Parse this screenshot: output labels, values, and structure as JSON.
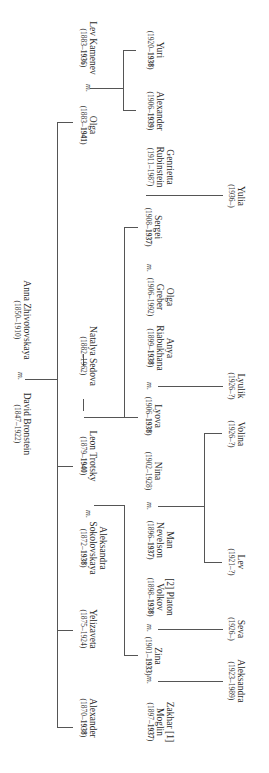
{
  "diagram": {
    "type": "family-tree",
    "orientation": "rotated-90-clockwise",
    "marriage_marker": "m.",
    "generations": [
      {
        "level": 1,
        "people": [
          {
            "id": "david",
            "name": "David Bronstein",
            "dates": "(1847–1922)"
          },
          {
            "id": "anna",
            "name": "Anna Zhivotovskaya",
            "dates": "(1850–1910)"
          }
        ],
        "couples": [
          [
            "david",
            "anna"
          ]
        ]
      },
      {
        "level": 2,
        "people": [
          {
            "id": "alexander_b",
            "name": "Alexander",
            "dates": "(1870–1938)"
          },
          {
            "id": "yelizaveta",
            "name": "Yelizaveta",
            "dates": "(1875–1924)"
          },
          {
            "id": "aleksandra_s",
            "name": "Aleksandra Sokolovskaya",
            "dates": "(1872–1938)"
          },
          {
            "id": "leon",
            "name": "Leon Trotsky",
            "dates": "(1879–1940)"
          },
          {
            "id": "natalya",
            "name": "Natalya Sedova",
            "dates": "(1882–1962)"
          },
          {
            "id": "olga_b",
            "name": "Olga",
            "dates": "(1883–1941)"
          },
          {
            "id": "kamenev",
            "name": "Lev Kamenev",
            "dates": "(1883–1936)"
          }
        ],
        "couples": [
          [
            "aleksandra_s",
            "leon"
          ],
          [
            "leon",
            "natalya"
          ],
          [
            "olga_b",
            "kamenev"
          ]
        ]
      },
      {
        "level": 3,
        "people": [
          {
            "id": "zakhar",
            "name": "Zakhar [1] Moglin",
            "dates": "(1897–1937)"
          },
          {
            "id": "zina",
            "name": "Zina",
            "dates": "(1901–1933)"
          },
          {
            "id": "platon",
            "name": "[2] Platon Volkov",
            "dates": "(1898–1938)"
          },
          {
            "id": "man",
            "name": "Man Nevelson",
            "dates": "(1896–1937)"
          },
          {
            "id": "nina",
            "name": "Nina",
            "dates": "(1902–1928)"
          },
          {
            "id": "lyova",
            "name": "Lyova",
            "dates": "(1906–1938)"
          },
          {
            "id": "anya",
            "name": "Anya Riabukhana",
            "dates": "(1899–1938)"
          },
          {
            "id": "olga_g",
            "name": "Olga Greber",
            "dates": "(1906–1992)"
          },
          {
            "id": "sergei",
            "name": "Sergei",
            "dates": "(1908–1937)"
          },
          {
            "id": "genrietta",
            "name": "Genrietta Rubinstein",
            "dates": "(1911–1987)"
          },
          {
            "id": "alexander_k",
            "name": "Alexander",
            "dates": "(1906–1939)"
          },
          {
            "id": "yuri",
            "name": "Yuri",
            "dates": "(1920–1938)"
          }
        ],
        "couples": [
          [
            "zakhar",
            "zina"
          ],
          [
            "zina",
            "platon"
          ],
          [
            "man",
            "nina"
          ],
          [
            "lyova",
            "anya"
          ],
          [
            "olga_g",
            "sergei"
          ],
          [
            "sergei",
            "genrietta"
          ]
        ]
      },
      {
        "level": 4,
        "people": [
          {
            "id": "aleksandra_m",
            "name": "Aleksandra",
            "dates": "(1923–1989)"
          },
          {
            "id": "seva",
            "name": "Seva",
            "dates": "(1926–)"
          },
          {
            "id": "lev_n",
            "name": "Lev",
            "dates": "(1921–?)"
          },
          {
            "id": "volina",
            "name": "Volina",
            "dates": "(1926–?)"
          },
          {
            "id": "lyulik",
            "name": "Lyulik",
            "dates": "(1926–?)"
          },
          {
            "id": "yulia",
            "name": "Yulia",
            "dates": "(1936–)"
          }
        ]
      }
    ]
  },
  "labels": {
    "david": {
      "name": "David Bronstein",
      "dates_pre": "(1847–1922)",
      "dates_bold": "",
      "dates_post": ""
    },
    "anna": {
      "name": "Anna Zhivotovskaya",
      "dates_pre": "(1850–1910)",
      "dates_bold": "",
      "dates_post": ""
    },
    "alexander_b": {
      "name": "Alexander",
      "dates_pre": "(1870–",
      "dates_bold": "1938",
      "dates_post": ")"
    },
    "yelizaveta": {
      "name": "Yelizaveta",
      "dates_pre": "(1875–1924)",
      "dates_bold": "",
      "dates_post": ""
    },
    "aleksandra_s_1": {
      "name": "Aleksandra"
    },
    "aleksandra_s_2": {
      "name": "Sokolovskaya",
      "dates_pre": "(1872–",
      "dates_bold": "1938",
      "dates_post": ")"
    },
    "leon": {
      "name": "Leon Trotsky",
      "dates_pre": "(1879–",
      "dates_bold": "1940",
      "dates_post": ")"
    },
    "natalya": {
      "name": "Natalya Sedova",
      "dates_pre": "(1882–1962)",
      "dates_bold": "",
      "dates_post": ""
    },
    "olga_b": {
      "name": "Olga",
      "dates_pre": "(1883–",
      "dates_bold": "1941",
      "dates_post": ")"
    },
    "kamenev": {
      "name": "Lev Kamenev",
      "dates_pre": "(1883–",
      "dates_bold": "1936",
      "dates_post": ")"
    },
    "zakhar_1": {
      "name": "Zakhar [1]"
    },
    "zakhar_2": {
      "name": "Moglin",
      "dates_pre": "(1897–",
      "dates_bold": "1937",
      "dates_post": ")"
    },
    "zina": {
      "name": "Zina",
      "dates_pre": "(1901–",
      "dates_bold": "1933",
      "dates_post": ")"
    },
    "platon_1": {
      "name": "[2] Platon"
    },
    "platon_2": {
      "name": "Volkov",
      "dates_pre": "(1898–",
      "dates_bold": "1938",
      "dates_post": ")"
    },
    "man_1": {
      "name": "Man"
    },
    "man_2": {
      "name": "Nevelson",
      "dates_pre": "(1896–",
      "dates_bold": "1937",
      "dates_post": ")"
    },
    "nina": {
      "name": "Nina",
      "dates_pre": "(1902–1928)",
      "dates_bold": "",
      "dates_post": ""
    },
    "lyova": {
      "name": "Lyova",
      "dates_pre": "(1906–",
      "dates_bold": "1938",
      "dates_post": ")"
    },
    "anya_1": {
      "name": "Anya"
    },
    "anya_2": {
      "name": "Riabukhana",
      "dates_pre": "(1899–",
      "dates_bold": "1938",
      "dates_post": ")"
    },
    "olga_g_1": {
      "name": "Olga"
    },
    "olga_g_2": {
      "name": "Greber",
      "dates_pre": "(1906–1992)",
      "dates_bold": "",
      "dates_post": ""
    },
    "sergei": {
      "name": "Sergei",
      "dates_pre": "(1908–",
      "dates_bold": "1937",
      "dates_post": ")"
    },
    "genrietta_1": {
      "name": "Genrietta"
    },
    "genrietta_2": {
      "name": "Rubinstein",
      "dates_pre": "(1911–1987)",
      "dates_bold": "",
      "dates_post": ""
    },
    "alexander_k": {
      "name": "Alexander",
      "dates_pre": "(1906–",
      "dates_bold": "1939",
      "dates_post": ")"
    },
    "yuri": {
      "name": "Yuri",
      "dates_pre": "(1920–",
      "dates_bold": "1938",
      "dates_post": ")"
    },
    "aleksandra_m": {
      "name": "Aleksandra",
      "dates_pre": "(1923–1989)",
      "dates_bold": "",
      "dates_post": ""
    },
    "seva": {
      "name": "Seva",
      "dates_pre": "(1926–)",
      "dates_bold": "",
      "dates_post": ""
    },
    "lev_n": {
      "name": "Lev",
      "dates_pre": "(1921–?)",
      "dates_bold": "",
      "dates_post": ""
    },
    "volina": {
      "name": "Volina",
      "dates_pre": "(1926–?)",
      "dates_bold": "",
      "dates_post": ""
    },
    "lyulik": {
      "name": "Lyulik",
      "dates_pre": "(1926–?)",
      "dates_bold": "",
      "dates_post": ""
    },
    "yulia": {
      "name": "Yulia",
      "dates_pre": "(1936–)",
      "dates_bold": "",
      "dates_post": ""
    }
  },
  "marker_text": "m."
}
